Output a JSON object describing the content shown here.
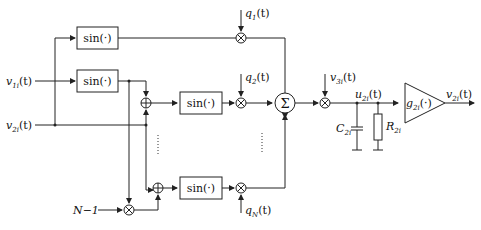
{
  "diagram": {
    "type": "block-diagram",
    "inputs": {
      "v1i": {
        "base": "v",
        "sub": "1i",
        "arg": "(t)"
      },
      "v2i": {
        "base": "v",
        "sub": "2i",
        "arg": "(t)"
      },
      "n_minus_1": "N−1"
    },
    "blocks": {
      "sin_label": "sin(·)",
      "sum_symbol": "Σ",
      "gain_label": {
        "base": "g",
        "sub": "2i",
        "arg": "(·)"
      }
    },
    "weights": {
      "q1": {
        "base": "q",
        "sub": "1",
        "arg": "(t)"
      },
      "q2": {
        "base": "q",
        "sub": "2",
        "arg": "(t)"
      },
      "qN": {
        "base": "q",
        "sub": "N",
        "arg": "(t)"
      }
    },
    "output_stage": {
      "v3i": {
        "base": "v",
        "sub": "3i",
        "arg": "(t)"
      },
      "u2i": {
        "base": "u",
        "sub": "2i",
        "arg": "(t)"
      },
      "c2i": {
        "base": "C",
        "sub": "2i"
      },
      "r2i": {
        "base": "R",
        "sub": "2i"
      },
      "out": {
        "base": "v",
        "sub": "2i",
        "arg": "(t)"
      }
    },
    "multiply_symbol": "⊗",
    "add_symbol": "⊕"
  }
}
